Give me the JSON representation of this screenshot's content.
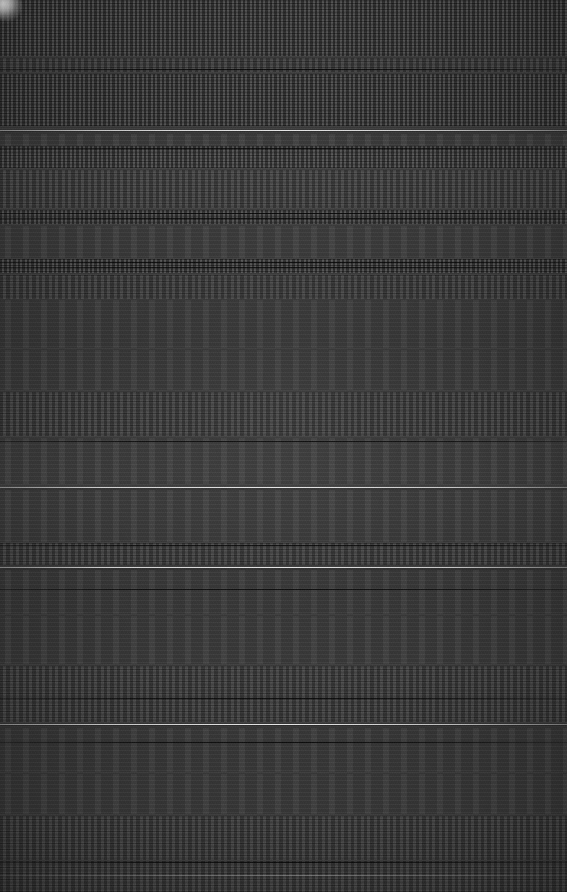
{
  "image": {
    "width": 567,
    "height": 892,
    "condition": "severely-degraded",
    "description": "Dark-themed full-width text/document view destroyed by horizontal scanline corruption; no text is legible.",
    "background_color": "#3a3a3a",
    "divider_color": "#f0f0f0",
    "text_smear_color": "#141414",
    "highlight_color": "#fcfcfc"
  },
  "artifacts": {
    "corner_blob": {
      "name": "top-left-bright-blob",
      "x": 0,
      "y": 0,
      "width": 22,
      "height": 21,
      "color": "#fcfcfc"
    }
  },
  "dividers": [
    {
      "y": 130,
      "style": "bright"
    },
    {
      "y": 487,
      "style": "bright"
    },
    {
      "y": 567,
      "style": "bright"
    },
    {
      "y": 724,
      "style": "bright"
    },
    {
      "y": 875,
      "style": "faint"
    }
  ],
  "dark_streaks": [
    {
      "y": 69
    },
    {
      "y": 148
    },
    {
      "y": 213
    },
    {
      "y": 218
    },
    {
      "y": 262
    },
    {
      "y": 267
    },
    {
      "y": 441
    },
    {
      "y": 545
    },
    {
      "y": 589
    },
    {
      "y": 698
    },
    {
      "y": 742
    },
    {
      "y": 862
    }
  ],
  "text_bands": [
    {
      "y": 0,
      "height": 56,
      "density": "dense"
    },
    {
      "y": 58,
      "height": 14,
      "density": "medium"
    },
    {
      "y": 74,
      "height": 52,
      "density": "dense"
    },
    {
      "y": 134,
      "height": 12,
      "density": "sparse"
    },
    {
      "y": 146,
      "height": 22,
      "density": "dense"
    },
    {
      "y": 170,
      "height": 38,
      "density": "medium"
    },
    {
      "y": 210,
      "height": 14,
      "density": "dense"
    },
    {
      "y": 226,
      "height": 32,
      "density": "sparse"
    },
    {
      "y": 259,
      "height": 14,
      "density": "dense"
    },
    {
      "y": 275,
      "height": 24,
      "density": "medium"
    },
    {
      "y": 300,
      "height": 48,
      "density": "sparse"
    },
    {
      "y": 350,
      "height": 40,
      "density": "sparse"
    },
    {
      "y": 392,
      "height": 44,
      "density": "medium"
    },
    {
      "y": 438,
      "height": 46,
      "density": "sparse"
    },
    {
      "y": 490,
      "height": 52,
      "density": "sparse"
    },
    {
      "y": 543,
      "height": 22,
      "density": "medium"
    },
    {
      "y": 570,
      "height": 44,
      "density": "sparse"
    },
    {
      "y": 616,
      "height": 48,
      "density": "sparse"
    },
    {
      "y": 666,
      "height": 30,
      "density": "medium"
    },
    {
      "y": 696,
      "height": 26,
      "density": "medium"
    },
    {
      "y": 728,
      "height": 44,
      "density": "sparse"
    },
    {
      "y": 774,
      "height": 40,
      "density": "sparse"
    },
    {
      "y": 816,
      "height": 44,
      "density": "medium"
    },
    {
      "y": 861,
      "height": 31,
      "density": "medium"
    }
  ]
}
